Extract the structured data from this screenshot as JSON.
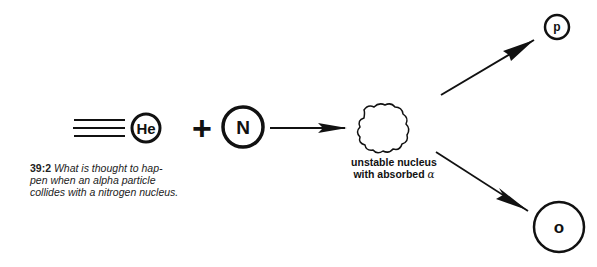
{
  "diagram": {
    "alpha_particle": {
      "symbol": "He"
    },
    "plus_sign": "+",
    "nitrogen": {
      "symbol": "N"
    },
    "intermediate": {
      "label_line1": "unstable nucleus",
      "label_line2": "with absorbed",
      "alpha_symbol": "α"
    },
    "product_proton": {
      "symbol": "p"
    },
    "product_oxygen": {
      "symbol": "o"
    }
  },
  "caption": {
    "number": "39:2",
    "text": "What is thought to hap- pen when an alpha particle collides with a nitrogen nucleus.",
    "lines": [
      "What is thought to hap-",
      "pen when an alpha particle",
      "collides with a nitrogen nucleus."
    ]
  },
  "colors": {
    "ink": "#111111",
    "background": "#ffffff"
  }
}
